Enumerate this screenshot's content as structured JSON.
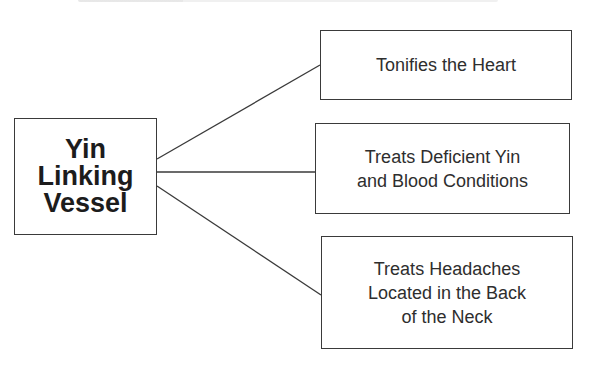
{
  "diagram": {
    "type": "concept-map",
    "center": {
      "label": "Yin\nLinking\nVessel"
    },
    "branches": [
      {
        "label": "Tonifies the Heart"
      },
      {
        "label": "Treats Deficient Yin\nand Blood Conditions"
      },
      {
        "label": "Treats Headaches\nLocated in the Back\nof the Neck"
      }
    ],
    "colors": {
      "line": "#3a3a3a",
      "text": "#2a2a2a",
      "background": "#ffffff"
    }
  }
}
